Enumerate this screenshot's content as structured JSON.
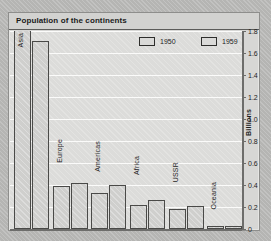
{
  "chart": {
    "title": "Population of the continents",
    "axis_title": "Billions"
  },
  "legend": {
    "items": [
      {
        "label": "1950"
      },
      {
        "label": "1959"
      }
    ]
  },
  "yticks": [
    "0",
    "0.2",
    "0.4",
    "0.6",
    "0.8",
    "1.0",
    "1.2",
    "1.4",
    "1.6",
    "1.8"
  ],
  "chart_data": {
    "type": "bar",
    "title": "Population of the continents",
    "xlabel": "",
    "ylabel": "Billions",
    "ylim": [
      0,
      1.8
    ],
    "ytick_step": 0.2,
    "grid": true,
    "legend_position": "top-right",
    "categories": [
      "Asia",
      "Europe",
      "Americas",
      "Africa",
      "USSR",
      "Oceania"
    ],
    "series": [
      {
        "name": "1950",
        "values": [
          1.92,
          0.39,
          0.33,
          0.22,
          0.18,
          0.03
        ]
      },
      {
        "name": "1959",
        "values": [
          1.71,
          0.42,
          0.4,
          0.26,
          0.21,
          0.03
        ]
      }
    ]
  }
}
